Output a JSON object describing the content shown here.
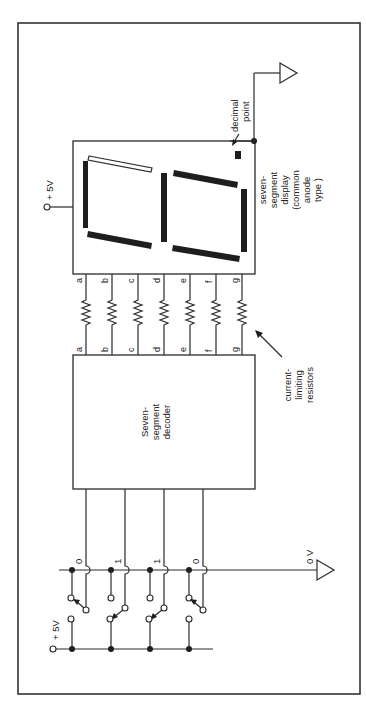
{
  "diagram": {
    "orientation": "rotated 90 degrees counter-clockwise",
    "supply": {
      "display_supply_label": "+ 5V",
      "switch_supply_label": "+ 5V",
      "ground_label": "0 V"
    },
    "display": {
      "label_lines": [
        "seven-",
        "segment",
        "display",
        "(common",
        "anode",
        "type )"
      ],
      "decimal_point_lines": [
        "decimal",
        "point"
      ],
      "segments_lit": [
        "a",
        "b",
        "c",
        "d",
        "e",
        "f"
      ],
      "segments_unlit": [
        "g"
      ]
    },
    "decoder": {
      "label_lines": [
        "Seven-",
        "segment",
        "decoder"
      ]
    },
    "resistors": {
      "label_lines": [
        "current-",
        "limiting",
        "resistors"
      ],
      "pins": [
        "a",
        "b",
        "c",
        "d",
        "e",
        "f",
        "g"
      ]
    },
    "switches": {
      "values": [
        "0",
        "1",
        "1",
        "0"
      ]
    },
    "colors": {
      "ink": "#1e1e1e",
      "background": "#ffffff"
    }
  }
}
